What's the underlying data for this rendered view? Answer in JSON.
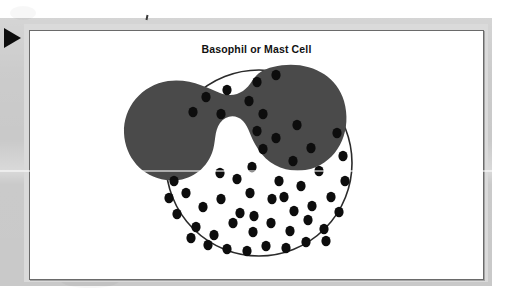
{
  "document": {
    "kind": "scanned-textbook-figure",
    "background_color": "#ffffff",
    "page_gray_color": "#c9c9c9",
    "mat_color": "#dadada"
  },
  "navigation": {
    "play_triangle_name": "play-triangle",
    "play_triangle_color": "#0d0d0d"
  },
  "artifacts": {
    "speck_label": "",
    "streak_label": ""
  },
  "figure": {
    "title": "Basophil or Mast Cell",
    "frame_color": "#6a6a6a",
    "background_color": "#ffffff"
  },
  "cell": {
    "name": "basophil-or-mast-cell",
    "membrane": {
      "label": "cell-membrane",
      "stroke_color": "#2b2b2b",
      "fill_color": "#ffffff",
      "center_x": 258,
      "center_y": 162,
      "radius": 93,
      "stroke_width": 1.6
    },
    "nucleus": {
      "label": "bilobed-nucleus",
      "fill_color": "#4a4a4a",
      "lobes": 2
    },
    "granules": {
      "label": "cytoplasmic-granules",
      "fill_color": "#0d0d0d",
      "count": 54,
      "radius_x": 4.6,
      "radius_y": 5.2,
      "points": [
        [
          226,
          89
        ],
        [
          248,
          100
        ],
        [
          256,
          81
        ],
        [
          275,
          74
        ],
        [
          205,
          96
        ],
        [
          192,
          111
        ],
        [
          220,
          113
        ],
        [
          256,
          130
        ],
        [
          262,
          148
        ],
        [
          251,
          166
        ],
        [
          275,
          137
        ],
        [
          262,
          113
        ],
        [
          292,
          160
        ],
        [
          278,
          180
        ],
        [
          300,
          185
        ],
        [
          318,
          170
        ],
        [
          336,
          132
        ],
        [
          342,
          155
        ],
        [
          330,
          196
        ],
        [
          311,
          205
        ],
        [
          293,
          210
        ],
        [
          271,
          198
        ],
        [
          249,
          192
        ],
        [
          239,
          212
        ],
        [
          220,
          198
        ],
        [
          202,
          206
        ],
        [
          185,
          192
        ],
        [
          176,
          213
        ],
        [
          195,
          226
        ],
        [
          213,
          234
        ],
        [
          232,
          222
        ],
        [
          252,
          231
        ],
        [
          270,
          222
        ],
        [
          289,
          230
        ],
        [
          307,
          219
        ],
        [
          323,
          228
        ],
        [
          338,
          211
        ],
        [
          344,
          180
        ],
        [
          265,
          245
        ],
        [
          285,
          247
        ],
        [
          305,
          241
        ],
        [
          246,
          250
        ],
        [
          226,
          248
        ],
        [
          207,
          244
        ],
        [
          190,
          237
        ],
        [
          173,
          180
        ],
        [
          168,
          197
        ],
        [
          296,
          124
        ],
        [
          310,
          147
        ],
        [
          236,
          178
        ],
        [
          219,
          172
        ],
        [
          325,
          240
        ],
        [
          253,
          215
        ],
        [
          283,
          196
        ]
      ]
    }
  }
}
